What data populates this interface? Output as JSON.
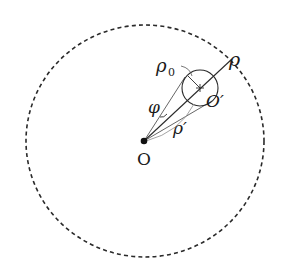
{
  "diagram": {
    "labels": {
      "rho": "ρ",
      "rho0_main": "ρ",
      "rho0_sub": "0",
      "phi": "φ",
      "rho_prime": "ρ′",
      "origin": "O",
      "o_prime": "O′"
    },
    "colors": {
      "stroke": "#2a2a2a",
      "light_stroke": "#9a9a9a",
      "background": "#ffffff"
    }
  }
}
